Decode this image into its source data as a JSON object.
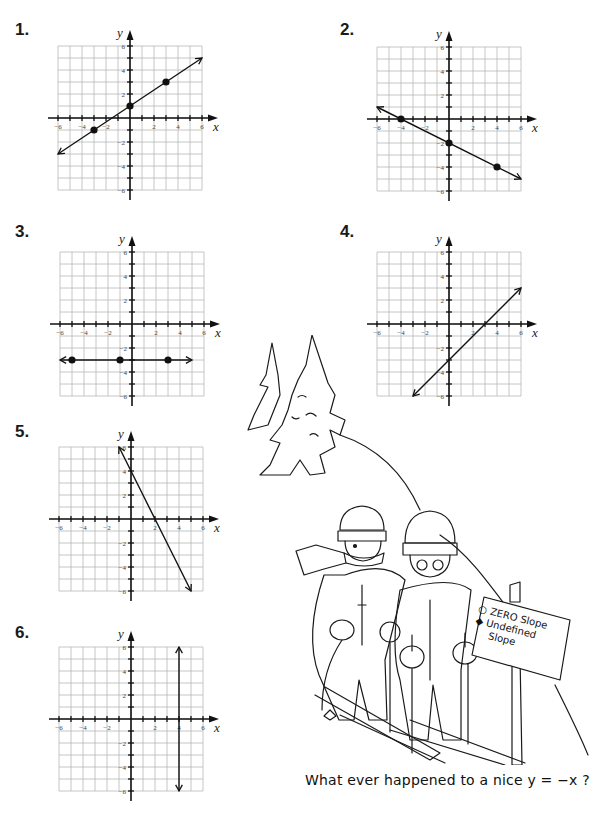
{
  "page": {
    "background": "#ffffff",
    "ink_color": "#111111",
    "grid_color": "#b8b8b8"
  },
  "problems": [
    {
      "label": "1.",
      "kind": "line",
      "points": [
        [
          -3,
          -1
        ],
        [
          0,
          1
        ],
        [
          3,
          3
        ]
      ],
      "line_from": [
        -6,
        -3
      ],
      "line_to": [
        6,
        5
      ],
      "arrows": "both",
      "equation": "y = (2/3)x + 1"
    },
    {
      "label": "2.",
      "kind": "line",
      "points": [
        [
          -4,
          0
        ],
        [
          0,
          -2
        ],
        [
          4,
          -4
        ]
      ],
      "line_from": [
        -6,
        1
      ],
      "line_to": [
        6,
        -5
      ],
      "arrows": "both",
      "equation": "y = -(1/2)x - 2"
    },
    {
      "label": "3.",
      "kind": "line",
      "points": [
        [
          -5,
          -3
        ],
        [
          -1,
          -3
        ],
        [
          3,
          -3
        ]
      ],
      "line_from": [
        -6,
        -3
      ],
      "line_to": [
        5,
        -3
      ],
      "arrows": "both",
      "equation": "y = -3"
    },
    {
      "label": "4.",
      "kind": "line",
      "points": [],
      "line_from": [
        -3,
        -6
      ],
      "line_to": [
        6,
        3
      ],
      "arrows": "both",
      "equation": "y = x - 3"
    },
    {
      "label": "5.",
      "kind": "line",
      "points": [],
      "line_from": [
        -1,
        6
      ],
      "line_to": [
        5,
        -6
      ],
      "arrows": "both",
      "equation": "y = -2x + 4"
    },
    {
      "label": "6.",
      "kind": "line",
      "points": [],
      "line_from": [
        4,
        6
      ],
      "line_to": [
        4,
        -6
      ],
      "arrows": "both",
      "equation": "x = 4"
    }
  ],
  "axes": {
    "x_label": "x",
    "y_label": "y",
    "x_ticks": [
      "-6",
      "-4",
      "-2",
      "2",
      "4",
      "6"
    ],
    "y_ticks": [
      "6",
      "4",
      "2",
      "-2",
      "-4",
      "-6"
    ],
    "range": [
      -6,
      6
    ]
  },
  "cartoon": {
    "sign_line1_symbol": "○",
    "sign_line1_text": "ZERO Slope",
    "sign_line2_symbol": "◆",
    "sign_line2_text": "Undefined",
    "sign_line3_text": "Slope"
  },
  "caption": "What ever happened to a nice y = −x ?",
  "chart_data": [
    {
      "type": "line",
      "title": "1.",
      "xlabel": "x",
      "ylabel": "y",
      "xlim": [
        -6,
        6
      ],
      "ylim": [
        -6,
        6
      ],
      "grid": true,
      "series": [
        {
          "name": "line",
          "x": [
            -6,
            -3,
            0,
            3,
            6
          ],
          "y": [
            -3,
            -1,
            1,
            3,
            5
          ]
        }
      ],
      "marked_points": [
        [
          -3,
          -1
        ],
        [
          0,
          1
        ],
        [
          3,
          3
        ]
      ]
    },
    {
      "type": "line",
      "title": "2.",
      "xlabel": "x",
      "ylabel": "y",
      "xlim": [
        -6,
        6
      ],
      "ylim": [
        -6,
        6
      ],
      "grid": true,
      "series": [
        {
          "name": "line",
          "x": [
            -6,
            -4,
            0,
            4,
            6
          ],
          "y": [
            1,
            0,
            -2,
            -4,
            -5
          ]
        }
      ],
      "marked_points": [
        [
          -4,
          0
        ],
        [
          0,
          -2
        ],
        [
          4,
          -4
        ]
      ]
    },
    {
      "type": "line",
      "title": "3.",
      "xlabel": "x",
      "ylabel": "y",
      "xlim": [
        -6,
        6
      ],
      "ylim": [
        -6,
        6
      ],
      "grid": true,
      "series": [
        {
          "name": "line",
          "x": [
            -6,
            -5,
            -1,
            3,
            5
          ],
          "y": [
            -3,
            -3,
            -3,
            -3,
            -3
          ]
        }
      ],
      "marked_points": [
        [
          -5,
          -3
        ],
        [
          -1,
          -3
        ],
        [
          3,
          -3
        ]
      ]
    },
    {
      "type": "line",
      "title": "4.",
      "xlabel": "x",
      "ylabel": "y",
      "xlim": [
        -6,
        6
      ],
      "ylim": [
        -6,
        6
      ],
      "grid": true,
      "series": [
        {
          "name": "line",
          "x": [
            -3,
            0,
            3,
            6
          ],
          "y": [
            -6,
            -3,
            0,
            3
          ]
        }
      ]
    },
    {
      "type": "line",
      "title": "5.",
      "xlabel": "x",
      "ylabel": "y",
      "xlim": [
        -6,
        6
      ],
      "ylim": [
        -6,
        6
      ],
      "grid": true,
      "series": [
        {
          "name": "line",
          "x": [
            -1,
            0,
            2,
            5
          ],
          "y": [
            6,
            4,
            0,
            -6
          ]
        }
      ]
    },
    {
      "type": "line",
      "title": "6.",
      "xlabel": "x",
      "ylabel": "y",
      "xlim": [
        -6,
        6
      ],
      "ylim": [
        -6,
        6
      ],
      "grid": true,
      "series": [
        {
          "name": "line",
          "x": [
            4,
            4
          ],
          "y": [
            6,
            -6
          ]
        }
      ]
    }
  ]
}
